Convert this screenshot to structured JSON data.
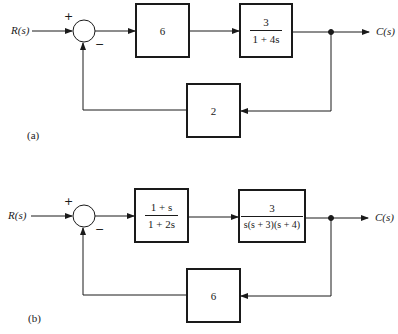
{
  "diagrams": [
    {
      "id": "a",
      "caption": "(a)",
      "input_label": "R(s)",
      "output_label": "C(s)",
      "summing_junction": {
        "plus_sign": "+",
        "minus_sign": "−"
      },
      "forward_blocks": [
        {
          "type": "constant",
          "value": "6"
        },
        {
          "type": "fraction",
          "numerator": "3",
          "denominator": "1 + 4s"
        }
      ],
      "feedback_block": {
        "type": "constant",
        "value": "2"
      }
    },
    {
      "id": "b",
      "caption": "(b)",
      "input_label": "R(s)",
      "output_label": "C(s)",
      "summing_junction": {
        "plus_sign": "+",
        "minus_sign": "−"
      },
      "forward_blocks": [
        {
          "type": "fraction",
          "numerator": "1 + s",
          "denominator": "1 + 2s"
        },
        {
          "type": "fraction",
          "numerator": "3",
          "denominator": "s(s + 3)(s + 4)"
        }
      ],
      "feedback_block": {
        "type": "constant",
        "value": "6"
      }
    }
  ],
  "colors": {
    "line": "#1a1a1a",
    "background": "#ffffff"
  }
}
